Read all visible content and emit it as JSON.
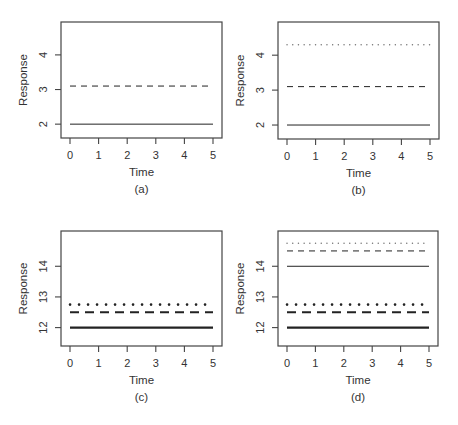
{
  "figure": {
    "panel_labels": [
      "(a)",
      "(b)",
      "(c)",
      "(d)"
    ]
  },
  "chart_data": [
    {
      "type": "line",
      "panel": "(a)",
      "xlabel": "Time",
      "ylabel": "Response",
      "xlim": [
        0,
        5
      ],
      "ylim": [
        1.6,
        4.95
      ],
      "xticks": [
        0,
        1,
        2,
        3,
        4,
        5
      ],
      "yticks": [
        2,
        3,
        4
      ],
      "grid": false,
      "legend": null,
      "series": [
        {
          "name": "solid",
          "style": "solid",
          "width": 1,
          "x": [
            0,
            5
          ],
          "y": [
            2.0,
            2.0
          ]
        },
        {
          "name": "dashed",
          "style": "dashed",
          "width": 1,
          "x": [
            0,
            5
          ],
          "y": [
            3.1,
            3.1
          ]
        }
      ]
    },
    {
      "type": "line",
      "panel": "(b)",
      "xlabel": "Time",
      "ylabel": "Response",
      "xlim": [
        0,
        5
      ],
      "ylim": [
        1.6,
        4.95
      ],
      "xticks": [
        0,
        1,
        2,
        3,
        4,
        5
      ],
      "yticks": [
        2,
        3,
        4
      ],
      "grid": false,
      "legend": null,
      "series": [
        {
          "name": "solid",
          "style": "solid",
          "width": 1,
          "x": [
            0,
            5
          ],
          "y": [
            2.0,
            2.0
          ]
        },
        {
          "name": "dashed",
          "style": "dashed",
          "width": 1,
          "x": [
            0,
            5
          ],
          "y": [
            3.1,
            3.1
          ]
        },
        {
          "name": "dotted",
          "style": "dotted",
          "width": 1,
          "x": [
            0,
            5
          ],
          "y": [
            4.3,
            4.3
          ]
        }
      ]
    },
    {
      "type": "line",
      "panel": "(c)",
      "xlabel": "Time",
      "ylabel": "Response",
      "xlim": [
        0,
        5
      ],
      "ylim": [
        11.4,
        15.15
      ],
      "xticks": [
        0,
        1,
        2,
        3,
        4,
        5
      ],
      "yticks": [
        12,
        13,
        14
      ],
      "grid": false,
      "legend": null,
      "series": [
        {
          "name": "thick solid",
          "style": "solid",
          "width": 2.2,
          "x": [
            0,
            5
          ],
          "y": [
            12.0,
            12.0
          ]
        },
        {
          "name": "thick dashed",
          "style": "dashed",
          "width": 2.2,
          "x": [
            0,
            5
          ],
          "y": [
            12.5,
            12.5
          ]
        },
        {
          "name": "thick dotted",
          "style": "dotted",
          "width": 2.2,
          "x": [
            0,
            5
          ],
          "y": [
            12.75,
            12.75
          ]
        }
      ]
    },
    {
      "type": "line",
      "panel": "(d)",
      "xlabel": "Time",
      "ylabel": "Response",
      "xlim": [
        0,
        5
      ],
      "ylim": [
        11.4,
        15.15
      ],
      "xticks": [
        0,
        1,
        2,
        3,
        4,
        5
      ],
      "yticks": [
        12,
        13,
        14
      ],
      "grid": false,
      "legend": null,
      "series": [
        {
          "name": "thick solid",
          "style": "solid",
          "width": 2.2,
          "x": [
            0,
            5
          ],
          "y": [
            12.0,
            12.0
          ]
        },
        {
          "name": "thick dashed",
          "style": "dashed",
          "width": 2.2,
          "x": [
            0,
            5
          ],
          "y": [
            12.5,
            12.5
          ]
        },
        {
          "name": "thick dotted",
          "style": "dotted",
          "width": 2.2,
          "x": [
            0,
            5
          ],
          "y": [
            12.75,
            12.75
          ]
        },
        {
          "name": "solid",
          "style": "solid",
          "width": 1,
          "x": [
            0,
            5
          ],
          "y": [
            14.0,
            14.0
          ]
        },
        {
          "name": "dashed",
          "style": "dashed",
          "width": 1,
          "x": [
            0,
            5
          ],
          "y": [
            14.5,
            14.5
          ]
        },
        {
          "name": "dotted",
          "style": "dotted",
          "width": 1,
          "x": [
            0,
            5
          ],
          "y": [
            14.75,
            14.75
          ]
        }
      ]
    }
  ]
}
